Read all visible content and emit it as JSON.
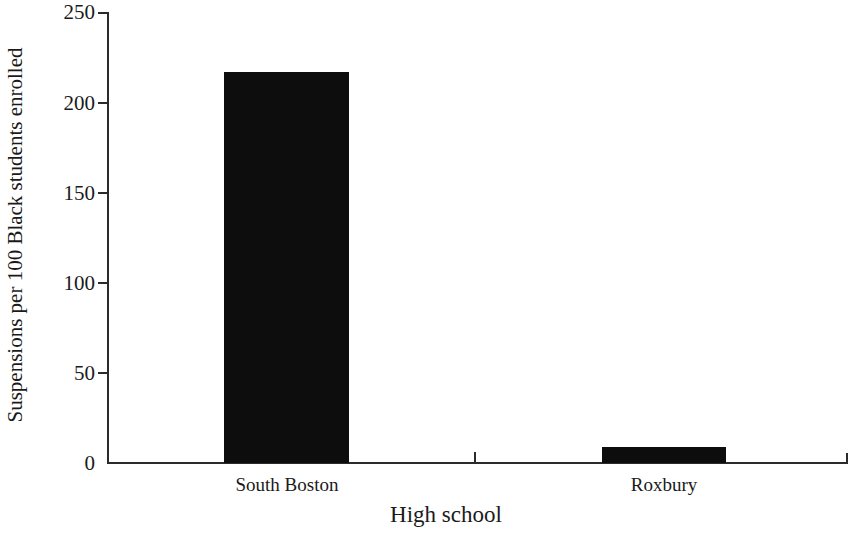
{
  "chart_data": {
    "type": "bar",
    "title": "",
    "xlabel": "High school",
    "ylabel": "Suspensions per 100 Black students enrolled",
    "categories": [
      "South Boston",
      "Roxbury"
    ],
    "values": [
      217,
      9
    ],
    "ylim": [
      0,
      250
    ],
    "yticks": [
      0,
      50,
      100,
      150,
      200,
      250
    ],
    "ytick_labels": [
      "0",
      "50",
      "100",
      "150",
      "200",
      "250"
    ],
    "grid": false,
    "legend": null,
    "bar_color": "#0d0d0d",
    "background_color": "#ffffff",
    "axis_color": "#2b2b2b"
  }
}
